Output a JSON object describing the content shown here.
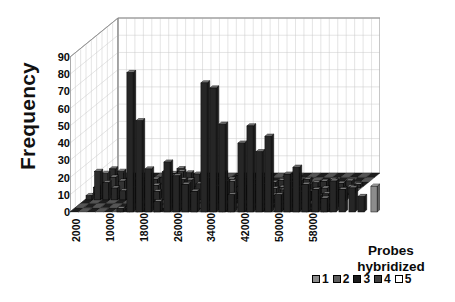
{
  "chart_data": {
    "type": "bar",
    "title": "",
    "subtitle": "",
    "xlabel": "",
    "ylabel": "Frequency",
    "zlabel": "Probes hybridized",
    "grid": true,
    "projection": "3d-column",
    "ylim": [
      0,
      90
    ],
    "yticks": [
      90,
      80,
      70,
      60,
      50,
      40,
      30,
      20,
      10,
      0
    ],
    "xticks": [
      "2000",
      "10000",
      "18000",
      "26000",
      "34000",
      "42000",
      "50000",
      "58000"
    ],
    "xlim": [
      0,
      62000
    ],
    "x_tick_step": 8000,
    "legend_title": "Probes hybridized",
    "legend_position": "bottom-right",
    "series": [
      {
        "name": "1",
        "color": "#8c8c8c",
        "values": [
          0,
          0,
          0,
          0,
          0,
          0,
          0,
          0,
          0,
          0,
          0,
          0,
          0,
          0,
          0,
          0,
          0,
          0,
          0,
          0,
          0,
          0,
          0,
          0,
          0,
          0,
          15,
          8,
          8,
          8,
          10
        ]
      },
      {
        "name": "2",
        "color": "#5e5e5e",
        "values": [
          0,
          0,
          2,
          3,
          2,
          3,
          2,
          2,
          3,
          2,
          3,
          3,
          4,
          3,
          4,
          5,
          4,
          4,
          3,
          3,
          3,
          2,
          2,
          2,
          2,
          2,
          2,
          2,
          1,
          1,
          1
        ]
      },
      {
        "name": "3",
        "color": "#262626",
        "values": [
          2,
          81,
          53,
          25,
          6,
          29,
          21,
          16,
          12,
          75,
          72,
          51,
          10,
          40,
          50,
          35,
          44,
          10,
          22,
          26,
          16,
          13,
          8,
          18,
          13,
          14,
          9,
          4,
          4,
          4,
          4
        ]
      },
      {
        "name": "4",
        "color": "#454545",
        "values": [
          1,
          3,
          3,
          4,
          3,
          4,
          5,
          4,
          5,
          6,
          5,
          5,
          4,
          5,
          4,
          5,
          4,
          4,
          4,
          4,
          3,
          3,
          3,
          3,
          3,
          2,
          2,
          2,
          2,
          2,
          2
        ]
      },
      {
        "name": "5",
        "color": "#ffffff",
        "values": [
          0,
          0,
          0,
          0,
          0,
          0,
          0,
          0,
          0,
          0,
          0,
          0,
          0,
          0,
          0,
          0,
          0,
          0,
          0,
          0,
          0,
          0,
          0,
          0,
          0,
          0,
          0,
          0,
          0,
          0,
          0
        ]
      }
    ],
    "x": [
      2000,
      4000,
      6000,
      8000,
      10000,
      12000,
      14000,
      16000,
      18000,
      20000,
      22000,
      24000,
      26000,
      28000,
      30000,
      32000,
      34000,
      36000,
      38000,
      40000,
      42000,
      44000,
      46000,
      48000,
      50000,
      52000,
      54000,
      56000,
      58000,
      60000,
      62000
    ],
    "front_bars": [
      {
        "x_px": 46,
        "h": 2,
        "series": 3
      },
      {
        "x_px": 56,
        "h": 81,
        "series": 3
      },
      {
        "x_px": 65,
        "h": 53,
        "series": 3
      },
      {
        "x_px": 74,
        "h": 25,
        "series": 3
      },
      {
        "x_px": 83,
        "h": 6,
        "series": 3
      },
      {
        "x_px": 93,
        "h": 29,
        "series": 3
      },
      {
        "x_px": 102,
        "h": 21,
        "series": 3
      },
      {
        "x_px": 111,
        "h": 16,
        "series": 3
      },
      {
        "x_px": 120,
        "h": 12,
        "series": 3
      },
      {
        "x_px": 130,
        "h": 75,
        "series": 3
      },
      {
        "x_px": 139,
        "h": 72,
        "series": 3
      },
      {
        "x_px": 148,
        "h": 51,
        "series": 3
      },
      {
        "x_px": 157,
        "h": 10,
        "series": 3
      },
      {
        "x_px": 167,
        "h": 40,
        "series": 3
      },
      {
        "x_px": 176,
        "h": 50,
        "series": 3
      },
      {
        "x_px": 185,
        "h": 35,
        "series": 3
      },
      {
        "x_px": 194,
        "h": 44,
        "series": 3
      },
      {
        "x_px": 204,
        "h": 10,
        "series": 3
      },
      {
        "x_px": 213,
        "h": 22,
        "series": 3
      },
      {
        "x_px": 222,
        "h": 26,
        "series": 3
      },
      {
        "x_px": 231,
        "h": 16,
        "series": 3
      },
      {
        "x_px": 241,
        "h": 13,
        "series": 3
      },
      {
        "x_px": 250,
        "h": 8,
        "series": 3
      },
      {
        "x_px": 259,
        "h": 18,
        "series": 3
      },
      {
        "x_px": 268,
        "h": 13,
        "series": 3
      },
      {
        "x_px": 278,
        "h": 14,
        "series": 3
      },
      {
        "x_px": 287,
        "h": 9,
        "series": 3
      },
      {
        "x_px": 300,
        "h": 15,
        "series": 1
      },
      {
        "x_px": 312,
        "h": 8,
        "series": 1
      },
      {
        "x_px": 321,
        "h": 8,
        "series": 1
      },
      {
        "x_px": 330,
        "h": 8,
        "series": 1
      },
      {
        "x_px": 339,
        "h": 10,
        "series": 1
      }
    ]
  },
  "axes": {
    "ylabel": "Frequency",
    "yticks": [
      "90",
      "80",
      "70",
      "60",
      "50",
      "40",
      "30",
      "20",
      "10",
      "0"
    ],
    "xticks": [
      "2000",
      "10000",
      "18000",
      "26000",
      "34000",
      "42000",
      "50000",
      "58000"
    ]
  },
  "depth_caption": {
    "line1": "Probes",
    "line2": "hybridized"
  },
  "legend": {
    "items": [
      {
        "label": "1",
        "color": "#8c8c8c"
      },
      {
        "label": "2",
        "color": "#5e5e5e"
      },
      {
        "label": "3",
        "color": "#1c1c1c"
      },
      {
        "label": "4",
        "color": "#3f3f3f"
      },
      {
        "label": "5",
        "color": "#ffffff"
      }
    ]
  }
}
